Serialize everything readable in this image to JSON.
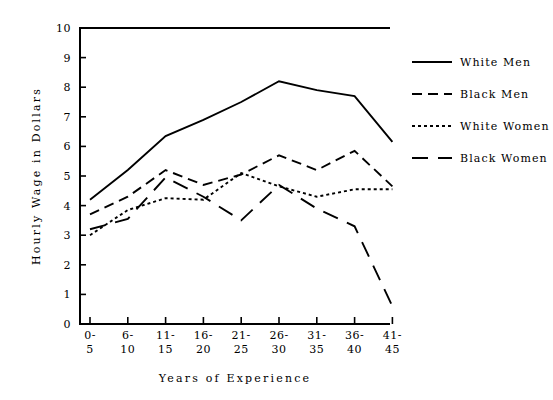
{
  "chart_data": {
    "type": "line",
    "title": "",
    "subtitle": "",
    "xlabel": "Years of Experience",
    "ylabel": "Hourly Wage in Dollars",
    "categories": [
      "0-\n5",
      "6-\n10",
      "11-\n15",
      "16-\n20",
      "21-\n25",
      "26-\n30",
      "31-\n35",
      "36-\n40",
      "41-\n45"
    ],
    "category_labels_top": [
      "0-",
      "6-",
      "11-",
      "16-",
      "21-",
      "26-",
      "31-",
      "36-",
      "41-"
    ],
    "category_labels_bottom": [
      "5",
      "10",
      "15",
      "20",
      "25",
      "30",
      "35",
      "40",
      "45"
    ],
    "ylim": [
      0,
      10
    ],
    "yticks": [
      0,
      1,
      2,
      3,
      4,
      5,
      6,
      7,
      8,
      9,
      10
    ],
    "ytick_labels": [
      "0",
      "1",
      "2",
      "3",
      "4",
      "5",
      "6",
      "7",
      "8",
      "9",
      "10"
    ],
    "grid": false,
    "legend_position": "right",
    "series": [
      {
        "name": "White Men",
        "style": "solid",
        "dash": "none",
        "color": "#000000",
        "values": [
          4.2,
          5.2,
          6.35,
          6.9,
          7.5,
          8.2,
          7.9,
          7.7,
          6.15
        ]
      },
      {
        "name": "Black Men",
        "style": "dashed",
        "dash": "10,6",
        "color": "#000000",
        "values": [
          3.7,
          4.3,
          5.2,
          4.7,
          5.05,
          5.7,
          5.2,
          5.85,
          4.65
        ]
      },
      {
        "name": "White Women",
        "style": "dotted",
        "dash": "3,3",
        "color": "#000000",
        "values": [
          3.0,
          3.85,
          4.25,
          4.2,
          5.1,
          4.65,
          4.3,
          4.55,
          4.55
        ]
      },
      {
        "name": "Black Women",
        "style": "long-dash",
        "dash": "16,10",
        "color": "#000000",
        "values": [
          3.2,
          3.55,
          4.95,
          4.3,
          3.5,
          4.7,
          3.9,
          3.3,
          0.6
        ]
      }
    ]
  },
  "legend": {
    "items": [
      {
        "label": "White Men"
      },
      {
        "label": "Black Men"
      },
      {
        "label": "White Women"
      },
      {
        "label": "Black Women"
      }
    ]
  },
  "axes": {
    "x_title": "Years of Experience",
    "y_title": "Hourly Wage in Dollars"
  }
}
